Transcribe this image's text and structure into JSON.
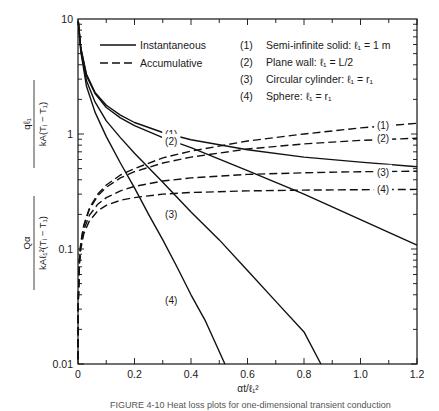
{
  "chart_data": {
    "type": "line",
    "title": "",
    "xlabel": "αt/ℓ₁²",
    "ylabel_top": "qℓ₁ / kA(Tᵢ − T₁)",
    "ylabel_bottom": "Qα / kAℓ₁²(Tᵢ − T₁)",
    "xlim": [
      0,
      1.2
    ],
    "ylim": [
      0.01,
      10
    ],
    "yscale": "log",
    "x_ticks": [
      "0",
      "0.2",
      "0.4",
      "0.6",
      "0.8",
      "1.0",
      "1.2"
    ],
    "y_ticks": [
      "0.01",
      "0.1",
      "1",
      "10"
    ],
    "grid": false,
    "legend": {
      "position": "upper left",
      "entries": [
        {
          "style": "solid",
          "label": "Instantaneous"
        },
        {
          "style": "dashed",
          "label": "Accumulative"
        }
      ]
    },
    "geometry_key": [
      {
        "id": "(1)",
        "label": "Semi-infinite solid:  ℓ₁ = 1 m"
      },
      {
        "id": "(2)",
        "label": "Plane wall:  ℓ₁ = L/2"
      },
      {
        "id": "(3)",
        "label": "Circular cylinder:  ℓ₁ = r₁"
      },
      {
        "id": "(4)",
        "label": "Sphere:  ℓ₁ = r₁"
      }
    ],
    "series": [
      {
        "name": "(1) Instantaneous",
        "style": "solid",
        "x": [
          0.001,
          0.01,
          0.03,
          0.06,
          0.1,
          0.15,
          0.2,
          0.3,
          0.4,
          0.6,
          0.8,
          1.0,
          1.2
        ],
        "y": [
          9.5,
          5.6,
          3.3,
          2.3,
          1.78,
          1.46,
          1.26,
          1.03,
          0.89,
          0.73,
          0.63,
          0.57,
          0.52
        ]
      },
      {
        "name": "(2) Instantaneous",
        "style": "solid",
        "x": [
          0.001,
          0.01,
          0.03,
          0.06,
          0.1,
          0.15,
          0.2,
          0.3,
          0.4,
          0.6,
          0.8,
          1.0,
          1.2
        ],
        "y": [
          9.5,
          5.6,
          3.2,
          2.25,
          1.7,
          1.38,
          1.18,
          0.93,
          0.76,
          0.48,
          0.3,
          0.18,
          0.108
        ]
      },
      {
        "name": "(3) Instantaneous",
        "style": "solid",
        "x": [
          0.001,
          0.01,
          0.03,
          0.06,
          0.1,
          0.15,
          0.2,
          0.3,
          0.4,
          0.5,
          0.6,
          0.7,
          0.8,
          0.86
        ],
        "y": [
          9.5,
          5.4,
          2.9,
          1.9,
          1.3,
          0.93,
          0.68,
          0.38,
          0.21,
          0.12,
          0.065,
          0.035,
          0.019,
          0.01
        ]
      },
      {
        "name": "(4) Instantaneous",
        "style": "solid",
        "x": [
          0.001,
          0.01,
          0.03,
          0.06,
          0.1,
          0.15,
          0.2,
          0.25,
          0.3,
          0.35,
          0.4,
          0.45,
          0.52
        ],
        "y": [
          9.5,
          5.2,
          2.6,
          1.55,
          0.95,
          0.56,
          0.34,
          0.2,
          0.12,
          0.07,
          0.04,
          0.024,
          0.01
        ]
      },
      {
        "name": "(1) Accumulative",
        "style": "dashed",
        "x": [
          0.0001,
          0.001,
          0.005,
          0.01,
          0.02,
          0.04,
          0.07,
          0.1,
          0.15,
          0.2,
          0.3,
          0.4,
          0.6,
          0.8,
          1.0,
          1.2
        ],
        "y": [
          0.011,
          0.036,
          0.08,
          0.113,
          0.16,
          0.226,
          0.3,
          0.36,
          0.44,
          0.5,
          0.62,
          0.71,
          0.87,
          1.0,
          1.13,
          1.24
        ]
      },
      {
        "name": "(2) Accumulative",
        "style": "dashed",
        "x": [
          0.0001,
          0.001,
          0.005,
          0.01,
          0.02,
          0.04,
          0.07,
          0.1,
          0.15,
          0.2,
          0.3,
          0.4,
          0.6,
          0.8,
          1.0,
          1.2
        ],
        "y": [
          0.011,
          0.036,
          0.08,
          0.112,
          0.158,
          0.22,
          0.29,
          0.345,
          0.415,
          0.47,
          0.56,
          0.63,
          0.74,
          0.82,
          0.88,
          0.92
        ]
      },
      {
        "name": "(3) Accumulative",
        "style": "dashed",
        "x": [
          0.0001,
          0.001,
          0.005,
          0.01,
          0.02,
          0.04,
          0.07,
          0.1,
          0.15,
          0.2,
          0.3,
          0.4,
          0.6,
          0.8,
          1.0,
          1.2
        ],
        "y": [
          0.011,
          0.035,
          0.077,
          0.107,
          0.146,
          0.196,
          0.245,
          0.28,
          0.32,
          0.35,
          0.39,
          0.415,
          0.445,
          0.46,
          0.47,
          0.475
        ]
      },
      {
        "name": "(4) Accumulative",
        "style": "dashed",
        "x": [
          0.0001,
          0.001,
          0.005,
          0.01,
          0.02,
          0.04,
          0.07,
          0.1,
          0.15,
          0.2,
          0.3,
          0.4,
          0.6,
          0.8,
          1.0,
          1.2
        ],
        "y": [
          0.011,
          0.034,
          0.073,
          0.1,
          0.135,
          0.175,
          0.215,
          0.24,
          0.265,
          0.28,
          0.3,
          0.31,
          0.32,
          0.325,
          0.328,
          0.33
        ]
      }
    ],
    "curve_labels": [
      {
        "text": "(1)",
        "x": 0.33,
        "y": 1.0
      },
      {
        "text": "(2)",
        "x": 0.33,
        "y": 0.87
      },
      {
        "text": "(3)",
        "x": 0.33,
        "y": 0.2
      },
      {
        "text": "(4)",
        "x": 0.33,
        "y": 0.036
      },
      {
        "text": "(1)",
        "x": 1.08,
        "y": 1.2
      },
      {
        "text": "(2)",
        "x": 1.08,
        "y": 0.92
      },
      {
        "text": "(3)",
        "x": 1.08,
        "y": 0.47
      },
      {
        "text": "(4)",
        "x": 1.08,
        "y": 0.33
      }
    ]
  },
  "caption": "FIGURE 4-10  Heat loss plots for one-dimensional transient conduction"
}
